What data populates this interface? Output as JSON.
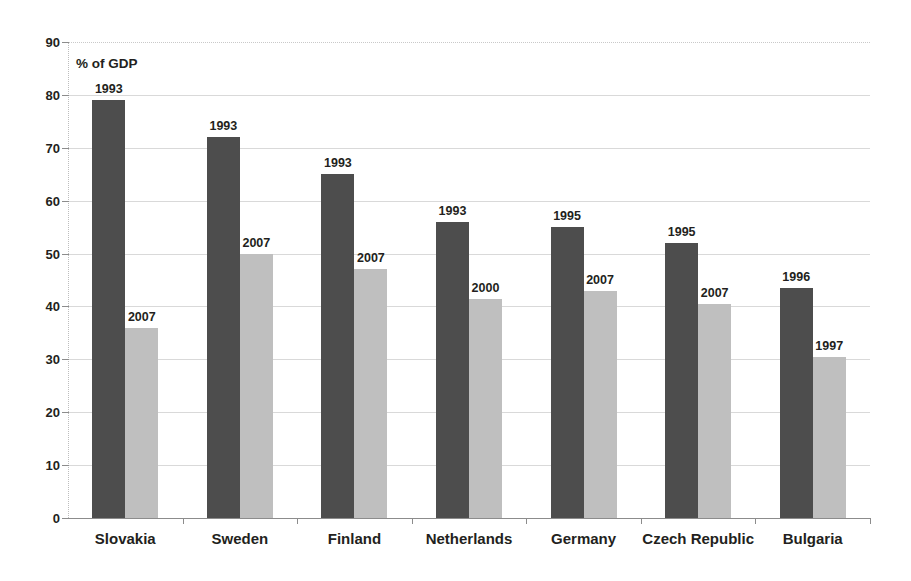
{
  "axis_title": "% of GDP",
  "chart_data": {
    "type": "bar",
    "title": "",
    "subtitle": "",
    "xlabel": "",
    "ylabel": "% of GDP",
    "ylim": [
      0,
      90
    ],
    "yticks": [
      0,
      10,
      20,
      30,
      40,
      50,
      60,
      70,
      80,
      90
    ],
    "ytick_labels": [
      "0",
      "10",
      "20",
      "30",
      "40",
      "50",
      "60",
      "70",
      "80",
      "90"
    ],
    "grid": true,
    "legend": "none",
    "categories": [
      "Slovakia",
      "Sweden",
      "Finland",
      "Netherlands",
      "Germany",
      "Czech Republic",
      "Bulgaria"
    ],
    "series": [
      {
        "name": "earlier year",
        "color": "#4d4d4d",
        "values": [
          79,
          72,
          65,
          56,
          55,
          52,
          43.5
        ],
        "point_labels": [
          "1993",
          "1993",
          "1993",
          "1993",
          "1995",
          "1995",
          "1996"
        ]
      },
      {
        "name": "later year",
        "color": "#bfbfbf",
        "values": [
          36,
          50,
          47,
          41.5,
          43,
          40.5,
          30.5
        ],
        "point_labels": [
          "2007",
          "2007",
          "2007",
          "2000",
          "2007",
          "2007",
          "1997"
        ]
      }
    ]
  },
  "colors": {
    "dark_bar": "#4d4d4d",
    "light_bar": "#bfbfbf",
    "gridline": "#d9d9d9",
    "axis": "#8c8c8c",
    "text": "#231f20"
  }
}
